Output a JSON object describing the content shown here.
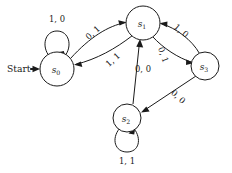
{
  "diagram": {
    "type": "finite-state-machine",
    "start": {
      "label": "Start",
      "target_state": "s0"
    },
    "states": [
      {
        "id": "s0",
        "base": "s",
        "sub": "0",
        "cx": 57,
        "cy": 69,
        "r": 17
      },
      {
        "id": "s1",
        "base": "s",
        "sub": "1",
        "cx": 143,
        "cy": 23,
        "r": 17
      },
      {
        "id": "s2",
        "base": "s",
        "sub": "2",
        "cx": 127,
        "cy": 118,
        "r": 14
      },
      {
        "id": "s3",
        "base": "s",
        "sub": "3",
        "cx": 205,
        "cy": 66,
        "r": 14
      }
    ],
    "transitions": [
      {
        "from": "s0",
        "to": "s0",
        "label": "1, 0",
        "kind": "self-loop",
        "lx": 57,
        "ly": 19,
        "rotate": 0
      },
      {
        "from": "s0",
        "to": "s1",
        "label": "0, 1",
        "kind": "edge",
        "lx": 93,
        "ly": 33,
        "rotate": -42
      },
      {
        "from": "s1",
        "to": "s0",
        "label": "1, 1",
        "kind": "edge",
        "lx": 113,
        "ly": 60,
        "rotate": -42
      },
      {
        "from": "s3",
        "to": "s1",
        "label": "1, 0",
        "kind": "edge",
        "lx": 181,
        "ly": 31,
        "rotate": 40
      },
      {
        "from": "s1",
        "to": "s3",
        "label": "0, 1",
        "kind": "edge",
        "lx": 163,
        "ly": 55,
        "rotate": 70
      },
      {
        "from": "s2",
        "to": "s1",
        "label": "0, 0",
        "kind": "edge",
        "lx": 143,
        "ly": 69,
        "rotate": 0
      },
      {
        "from": "s3",
        "to": "s2",
        "label": "0, 0",
        "kind": "edge",
        "lx": 178,
        "ly": 97,
        "rotate": 42
      },
      {
        "from": "s2",
        "to": "s2",
        "label": "1, 1",
        "kind": "self-loop",
        "lx": 127,
        "ly": 161,
        "rotate": 0
      }
    ]
  },
  "colors": {
    "ink": "#1a1a1a",
    "background": "#ffffff"
  }
}
